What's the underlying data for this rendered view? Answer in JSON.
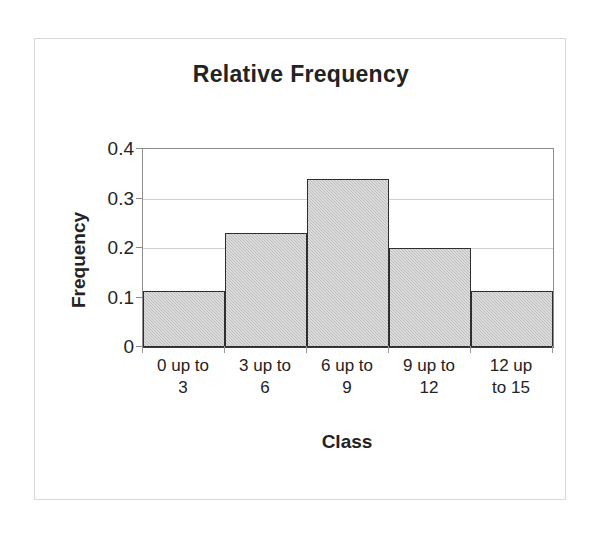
{
  "chart_data": {
    "type": "bar",
    "title": "Relative Frequency",
    "subtitle": "",
    "xlabel": "Class",
    "ylabel": "Frequency",
    "categories": [
      "0 up to 3",
      "3 up to 6",
      "6 up to 9",
      "9 up to 12",
      "12 up to 15"
    ],
    "category_lines": [
      [
        "0 up to",
        "3"
      ],
      [
        "3 up to",
        "6"
      ],
      [
        "6 up to",
        "9"
      ],
      [
        "9 up to",
        "12"
      ],
      [
        "12 up",
        "to 15"
      ]
    ],
    "values": [
      0.113,
      0.23,
      0.34,
      0.2,
      0.113
    ],
    "ylim": [
      0,
      0.4
    ],
    "y_ticks": [
      0,
      0.1,
      0.2,
      0.3,
      0.4
    ],
    "y_tick_labels": [
      "0",
      "0.1",
      "0.2",
      "0.3",
      "0.4"
    ],
    "grid": "horizontal",
    "legend": "none",
    "bar_gap": 0,
    "colors": {
      "bar_fill": "#c9c9c9",
      "bar_border": "#2e2e2e",
      "gridline": "#d0d0d0",
      "axis": "#8d8d8d",
      "baseline": "#3a3a3a",
      "text": "#232323",
      "frame_border": "#d9d9d9",
      "background": "#ffffff"
    }
  },
  "figure": {
    "title": "Relative Frequency",
    "x_axis_title": "Class",
    "y_axis_title": "Frequency"
  }
}
